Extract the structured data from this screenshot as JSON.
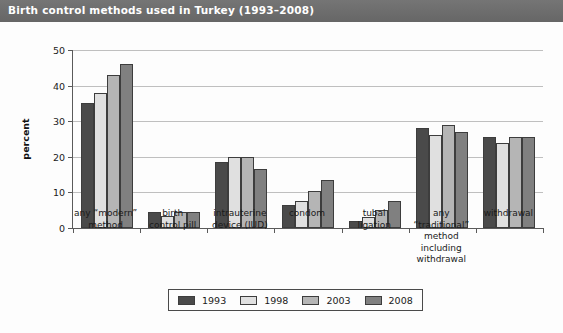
{
  "title": "Birth control methods used in Turkey (1993–2008)",
  "chart_data": {
    "type": "bar",
    "title": "Birth control methods used in Turkey (1993–2008)",
    "xlabel": "",
    "ylabel": "percent",
    "ylim": [
      0,
      50
    ],
    "yticks": [
      0,
      10,
      20,
      30,
      40,
      50
    ],
    "grid": true,
    "legend_position": "bottom",
    "categories": [
      "any “modern” method",
      "birth control pill",
      "intrauterine device (IUD)",
      "condom",
      "tubal ligation",
      "any “traditional” method including withdrawal",
      "withdrawal"
    ],
    "category_lines": [
      [
        "any “modern”",
        "method"
      ],
      [
        "birth",
        "control pill"
      ],
      [
        "intrauterine",
        "device (IUD)"
      ],
      [
        "condom"
      ],
      [
        "tubal",
        "ligation"
      ],
      [
        "any",
        "“traditional”",
        "method",
        "including",
        "withdrawal"
      ],
      [
        "withdrawal"
      ]
    ],
    "series": [
      {
        "name": "1993",
        "color": "#4a4a4a",
        "values": [
          35,
          4.5,
          18.5,
          6.5,
          2,
          28,
          25.5
        ]
      },
      {
        "name": "1998",
        "color": "#e0e0e0",
        "values": [
          38,
          3.5,
          20,
          7.5,
          3,
          26,
          24
        ]
      },
      {
        "name": "2003",
        "color": "#b5b5b5",
        "values": [
          43,
          4.5,
          20,
          10.5,
          5,
          29,
          25.5
        ]
      },
      {
        "name": "2008",
        "color": "#808080",
        "values": [
          46,
          4.5,
          16.5,
          13.5,
          7.5,
          27,
          25.5
        ]
      }
    ]
  },
  "legend": {
    "entries": [
      {
        "label": "1993",
        "color": "#4a4a4a"
      },
      {
        "label": "1998",
        "color": "#e0e0e0"
      },
      {
        "label": "2003",
        "color": "#b5b5b5"
      },
      {
        "label": "2008",
        "color": "#808080"
      }
    ]
  }
}
